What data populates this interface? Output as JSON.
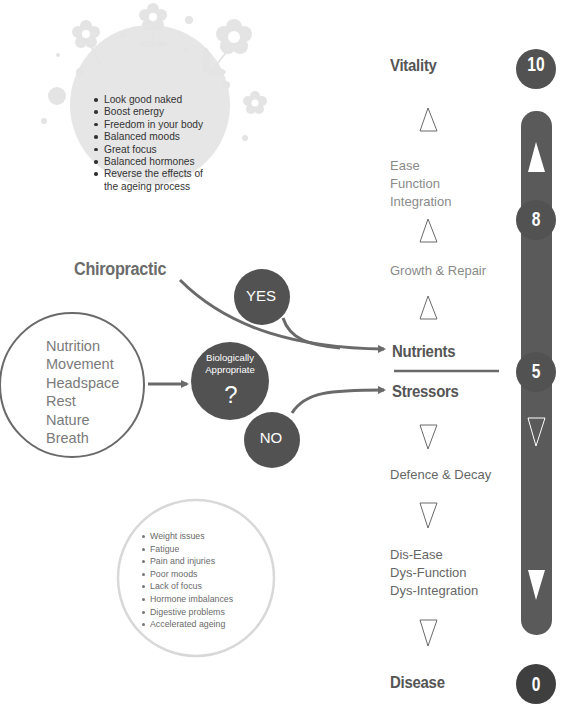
{
  "benefits": {
    "items": [
      "Look good naked",
      "Boost energy",
      "Freedom in your body",
      "Balanced moods",
      "Great focus",
      "Balanced hormones",
      "Reverse the effects of",
      "the ageing process"
    ]
  },
  "chiropractic": {
    "label": "Chiropractic"
  },
  "inputs": {
    "items": [
      "Nutrition",
      "Movement",
      "Headspace",
      "Rest",
      "Nature",
      "Breath"
    ]
  },
  "decision": {
    "line1": "Biologically",
    "line2": "Appropriate",
    "mark": "?",
    "yes": "YES",
    "no": "NO"
  },
  "symptoms": {
    "items": [
      "Weight issues",
      "Fatigue",
      "Pain and injuries",
      "Poor moods",
      "Lack of focus",
      "Hormone imbalances",
      "Digestive problems",
      "Accelerated ageing"
    ]
  },
  "ladder": {
    "vitality": "Vitality",
    "ease": [
      "Ease",
      "Function",
      "Integration"
    ],
    "growth": "Growth & Repair",
    "nutrients": "Nutrients",
    "stressors": "Stressors",
    "defence": "Defence & Decay",
    "disease_stack": [
      "Dis-Ease",
      "Dys-Function",
      "Dys-Integration"
    ],
    "disease": "Disease"
  },
  "scale": {
    "top": "10",
    "upper": "8",
    "middle": "5",
    "bottom": "0"
  },
  "colors": {
    "dark_circle": "#505050",
    "bar": "#5a5a5a",
    "decor": "#e2e2e2",
    "line": "#6a6a6a"
  }
}
